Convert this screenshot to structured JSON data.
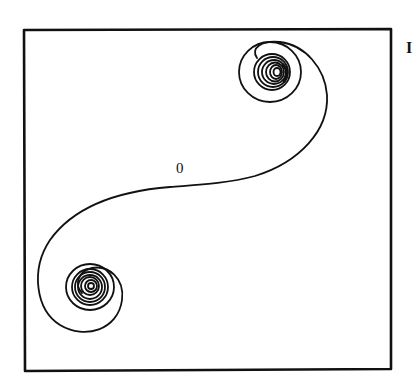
{
  "figure": {
    "type": "contour-plot",
    "panel_label": "I",
    "frame": {
      "left": 24,
      "top": 29,
      "right": 391,
      "bottom": 370,
      "stroke": "#111111"
    },
    "ink_color": "#111111",
    "background": "#ffffff"
  },
  "contours": {
    "zero_label": "0",
    "vortices": [
      {
        "name": "upper-right-vortex",
        "cx": 273,
        "cy": 72,
        "ring_radii": [
          3,
          6,
          9,
          12,
          15,
          18,
          24
        ]
      },
      {
        "name": "lower-left-vortex",
        "cx": 90,
        "cy": 287,
        "ring_radii": [
          3,
          6,
          9,
          12,
          15,
          18,
          24
        ]
      }
    ]
  }
}
